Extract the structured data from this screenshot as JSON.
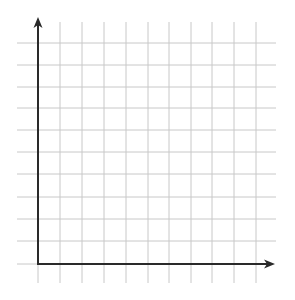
{
  "diagram": {
    "type": "blank-coordinate-grid",
    "quadrants": "first-quadrant",
    "colors": {
      "background": "#ffffff",
      "grid": "#c8c8c8",
      "axis": "#2a2a2a"
    },
    "grid": {
      "vertical_x": [
        60,
        82,
        104,
        126,
        148,
        169,
        191,
        212,
        234,
        256
      ],
      "vertical_y_range": [
        22,
        283
      ],
      "horizontal_y": [
        43,
        65,
        87,
        108,
        130,
        152,
        174,
        197,
        219,
        241
      ],
      "horizontal_x_range": [
        17,
        276
      ],
      "extension_below_axis_x": [
        38,
        60,
        82,
        104,
        126,
        148,
        169,
        191,
        212,
        234,
        256
      ],
      "extension_left_of_axis_y": [
        264
      ]
    },
    "axes": {
      "origin": [
        38,
        264
      ],
      "y_axis_top": 17,
      "x_axis_right": 275,
      "labels": []
    }
  }
}
